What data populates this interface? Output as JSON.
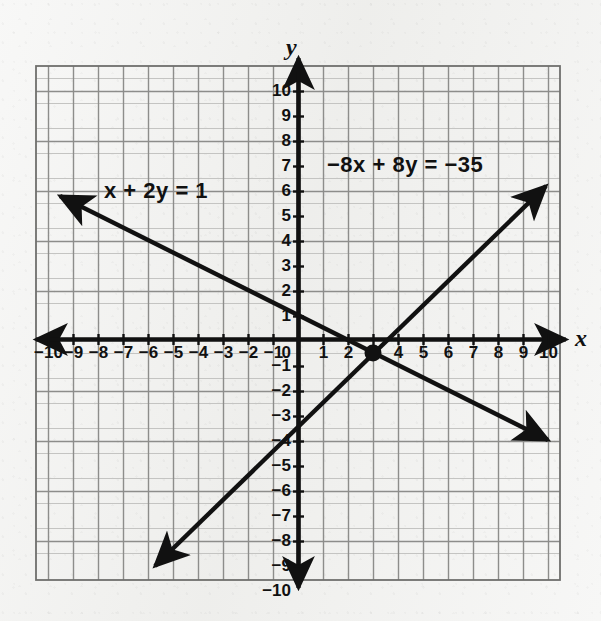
{
  "figure": {
    "kind": "coordinate-plane-graph",
    "background_color": "#efefed",
    "ink_color": "#111111",
    "grid_color": "#8a8a8a",
    "grid_minor_color": "#bdbdbd"
  },
  "axes": {
    "x_name": "x",
    "y_name": "y",
    "x_ticks": [
      "-10",
      "-9",
      "-8",
      "-7",
      "-6",
      "-5",
      "-4",
      "-3",
      "-2",
      "-1",
      "1",
      "2",
      "3",
      "4",
      "5",
      "6",
      "7",
      "8",
      "9",
      "10"
    ],
    "y_ticks": [
      "10",
      "9",
      "8",
      "7",
      "6",
      "5",
      "4",
      "3",
      "2",
      "1",
      "-1",
      "-2",
      "-3",
      "-4",
      "-5",
      "-6",
      "-7",
      "-8",
      "-9",
      "-10"
    ],
    "origin_label": "0"
  },
  "labels": {
    "line1": "x + 2y = 1",
    "line2": "−8x + 8y = −35"
  },
  "chart_data": {
    "type": "line",
    "title": "",
    "xlabel": "x",
    "ylabel": "y",
    "xlim": [
      -10.5,
      10.5
    ],
    "ylim": [
      -10.5,
      10.5
    ],
    "grid": true,
    "legend": "none",
    "series": [
      {
        "name": "x + 2y = 1",
        "equation": "x + 2y = 1",
        "slope": -0.5,
        "intercept": 0.5,
        "points": [
          [
            -10,
            5.5
          ],
          [
            0,
            0.5
          ],
          [
            10,
            -4.5
          ]
        ],
        "arrows": "both"
      },
      {
        "name": "-8x + 8y = -35",
        "equation": "−8x + 8y = −35",
        "slope": 1,
        "intercept": -4.375,
        "points": [
          [
            -6,
            -10.375
          ],
          [
            0,
            -4.375
          ],
          [
            10,
            5.625
          ]
        ],
        "arrows": "both"
      }
    ],
    "annotations": [
      {
        "name": "intersection-point",
        "x": 3.375,
        "y": -1.1875,
        "marker": "filled-circle"
      }
    ]
  }
}
